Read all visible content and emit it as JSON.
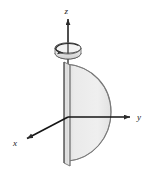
{
  "figure": {
    "background_color": "#ffffff",
    "stroke_color": "#2b2b2b",
    "surface_fill": "#e9e9e9",
    "plate_fill": "#f4f4f4",
    "shade_fill": "#cfcfcf",
    "axes": [
      {
        "name": "z-axis",
        "label": "z",
        "direction": "up",
        "label_x": 68,
        "label_y": 13,
        "arrow_tip_x": 68,
        "arrow_tip_y": 17,
        "origin_x": 68,
        "origin_y": 117
      },
      {
        "name": "y-axis",
        "label": "y",
        "direction": "right",
        "label_x": 138,
        "label_y": 116,
        "arrow_tip_x": 131,
        "arrow_tip_y": 117,
        "origin_x": 68,
        "origin_y": 117
      },
      {
        "name": "x-axis",
        "label": "x",
        "direction": "down-left",
        "label_x": 15,
        "label_y": 143,
        "arrow_tip_x": 26,
        "arrow_tip_y": 139,
        "origin_x": 68,
        "origin_y": 117
      }
    ],
    "rotation_arrow": {
      "name": "rotation-arrow",
      "center_x": 68,
      "center_y": 48,
      "rx": 13,
      "ry": 5,
      "depth": 9,
      "description": "curved 3D arrow encircling the z-axis indicating revolution"
    },
    "semicircle": {
      "name": "semicircular-region",
      "center_x": 70,
      "center_y": 110,
      "radius_x": 41,
      "radius_y": 52,
      "top_y": 64,
      "bottom_y": 161,
      "right_x": 111
    },
    "plate": {
      "name": "vertical-plate",
      "left_x": 63,
      "right_x": 70,
      "top_y": 62,
      "bottom_y": 166,
      "skew": 5
    }
  }
}
